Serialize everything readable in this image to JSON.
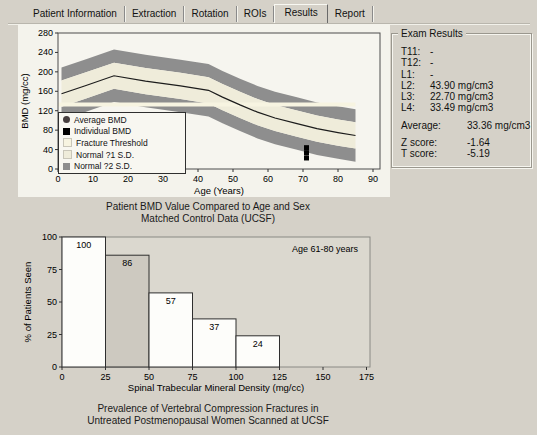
{
  "tabs": {
    "items": [
      {
        "label": "Patient Information",
        "active": false
      },
      {
        "label": "Extraction",
        "active": false
      },
      {
        "label": "Rotation",
        "active": false
      },
      {
        "label": "ROIs",
        "active": false
      },
      {
        "label": "Results",
        "active": true
      },
      {
        "label": "Report",
        "active": false
      }
    ]
  },
  "exam_results": {
    "title": "Exam Results",
    "vertebrae": [
      {
        "label": "T11:",
        "value": "-"
      },
      {
        "label": "T12:",
        "value": "-"
      },
      {
        "label": "L1:",
        "value": "-"
      },
      {
        "label": "L2:",
        "value": "43.90 mg/cm3"
      },
      {
        "label": "L3:",
        "value": "22.70 mg/cm3"
      },
      {
        "label": "L4:",
        "value": "33.49 mg/cm3"
      }
    ],
    "average": {
      "label": "Average:",
      "value": "33.36 mg/cm3"
    },
    "scores": [
      {
        "label": "Z score:",
        "value": "-1.64"
      },
      {
        "label": "T score:",
        "value": "-5.19"
      }
    ]
  },
  "chart_data": [
    {
      "type": "line",
      "caption_lines": [
        "Patient BMD Value Compared to Age and Sex",
        "Matched Control Data (UCSF)"
      ],
      "xlabel": "Age (Years)",
      "ylabel": "BMD (mg/cc)",
      "xlim": [
        0,
        92
      ],
      "ylim": [
        0,
        280
      ],
      "x_ticks": [
        0,
        10,
        20,
        30,
        40,
        50,
        60,
        70,
        80,
        90
      ],
      "y_ticks": [
        0,
        40,
        80,
        120,
        160,
        200,
        240,
        280
      ],
      "average_series": {
        "age": [
          1,
          8,
          16,
          25,
          35,
          43,
          47,
          52,
          57,
          62,
          68,
          74,
          80,
          85
        ],
        "bmd": [
          155,
          172,
          192,
          181,
          171,
          162,
          148,
          132,
          117,
          105,
          94,
          83,
          75,
          69
        ]
      },
      "sd_bands": {
        "sd1": 27,
        "sd2": 54
      },
      "fracture_threshold": 133,
      "individual_points": {
        "age": 71,
        "values": [
          43.9,
          33.49,
          22.7
        ]
      },
      "average_point": {
        "age": 71,
        "value": 33.36
      },
      "legend": [
        {
          "label": "Average BMD",
          "marker": "circle",
          "color": "#463e3e"
        },
        {
          "label": "Individual BMD",
          "marker": "square",
          "color": "#000000"
        },
        {
          "label": "Fracture Threshold",
          "marker": "square",
          "color": "#f7f4e1"
        },
        {
          "label": "Normal ?1 S.D.",
          "marker": "square",
          "color": "#efecda"
        },
        {
          "label": "Normal ?2 S.D.",
          "marker": "square",
          "color": "#8e8e8e"
        }
      ],
      "colors": {
        "band_dark": "#8e8e8e",
        "band_light": "#efecda",
        "threshold": "#f7f4e1",
        "line": "#1c1c1c",
        "plot_bg": "#f6f5ef",
        "frame": "#4d4d4d"
      }
    },
    {
      "type": "bar",
      "caption_lines": [
        "Prevalence of Vertebral Compression Fractures in",
        "Untreated Postmenopausal Women Scanned at UCSF"
      ],
      "xlabel": "Spinal Trabecular Mineral Density (mg/cc)",
      "ylabel": "% of Patients Seen",
      "annotation": "Age 61-80 years",
      "x_ticks": [
        0,
        25,
        50,
        75,
        100,
        125,
        150,
        175
      ],
      "y_ticks": [
        0,
        25,
        50,
        75,
        100
      ],
      "xlim": [
        0,
        178
      ],
      "ylim": [
        0,
        100
      ],
      "bin_width": 25,
      "bars": [
        {
          "range": [
            0,
            25
          ],
          "value": 100,
          "highlighted": false
        },
        {
          "range": [
            25,
            50
          ],
          "value": 86,
          "highlighted": true
        },
        {
          "range": [
            50,
            75
          ],
          "value": 57,
          "highlighted": false
        },
        {
          "range": [
            75,
            100
          ],
          "value": 37,
          "highlighted": false
        },
        {
          "range": [
            100,
            125
          ],
          "value": 24,
          "highlighted": false
        }
      ],
      "colors": {
        "bar": "#fdfdfa",
        "bar_highlighted": "#cdc9c0",
        "plot_bg": "#dbd8cf",
        "frame": "#8a8a84"
      }
    }
  ]
}
